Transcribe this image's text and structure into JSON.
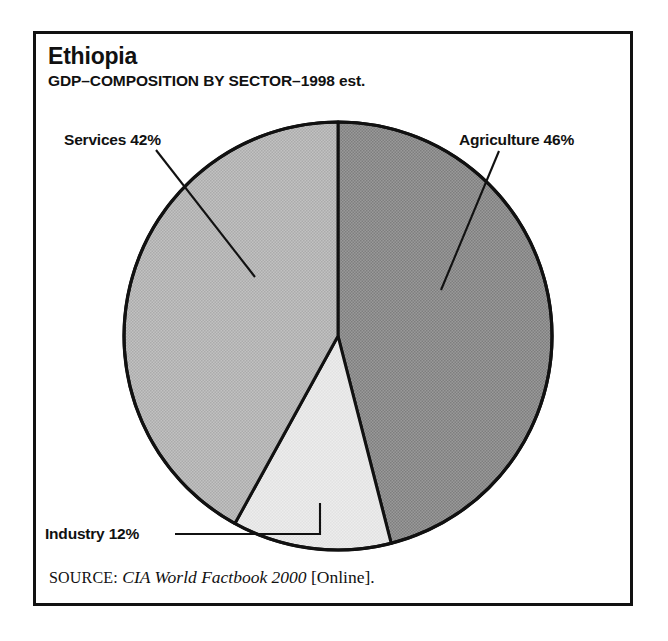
{
  "figure": {
    "title": "Ethiopia",
    "subtitle": "GDP–COMPOSITION BY SECTOR–1998 est.",
    "frame_color": "#111111",
    "background": "#ffffff"
  },
  "labels": {
    "services": "Services 42%",
    "agriculture": "Agriculture 46%",
    "industry": "Industry 12%"
  },
  "source": {
    "kicker": "SOURCE:",
    "title": "CIA World Factbook 2000",
    "medium": "[Online]."
  },
  "chart_data": {
    "type": "pie",
    "title": "Ethiopia",
    "subtitle": "GDP–COMPOSITION BY SECTOR–1998 est.",
    "categories": [
      "Agriculture",
      "Industry",
      "Services"
    ],
    "values": [
      46,
      12,
      42
    ],
    "unit": "%",
    "labels": [
      "Agriculture 46%",
      "Industry 12%",
      "Services 42%"
    ],
    "colors": [
      "#8f8f8f",
      "#e8e8e8",
      "#b8b8b8"
    ],
    "stroke": "#111111",
    "start_angle_deg": 0,
    "direction": "clockwise",
    "center": [
      338,
      336
    ],
    "radius": 214,
    "legend": "none",
    "grid": false,
    "annotations": [
      "Agriculture 46%",
      "Industry 12%",
      "Services 42%"
    ]
  }
}
